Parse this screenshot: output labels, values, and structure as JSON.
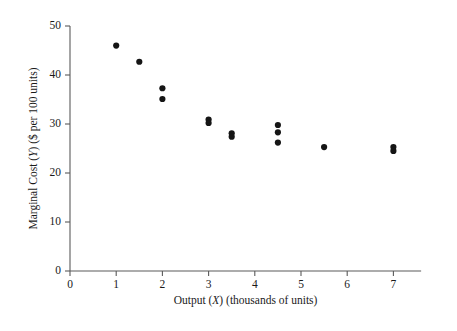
{
  "chart_data": {
    "type": "scatter",
    "title": "",
    "xlabel": "Output (X) (thousands of units)",
    "ylabel": "Marginal Cost (Y) ($ per 100 units)",
    "xlabel_parts": {
      "pre": "Output (",
      "var": "X",
      "post": ") (thousands of units)"
    },
    "ylabel_parts": {
      "pre": "Marginal Cost (",
      "var": "Y",
      "post": ") ($ per 100 units)"
    },
    "xlim": [
      0,
      7.6
    ],
    "ylim": [
      0,
      50
    ],
    "xticks": [
      0,
      1,
      2,
      3,
      4,
      5,
      6,
      7
    ],
    "xtick_labels": [
      "0",
      "1",
      "2",
      "3",
      "4",
      "5",
      "6",
      "7"
    ],
    "yticks": [
      0,
      10,
      20,
      30,
      40,
      50
    ],
    "ytick_labels": [
      "0",
      "10",
      "20",
      "30",
      "40",
      "50"
    ],
    "grid": false,
    "legend": false,
    "marker_color": "#151515",
    "axis_color": "#5a5a5a",
    "background": "#ffffff",
    "x": [
      1.0,
      1.5,
      2.0,
      2.0,
      3.0,
      3.0,
      3.5,
      3.5,
      4.5,
      4.5,
      4.5,
      5.5,
      7.0,
      7.0
    ],
    "y": [
      46.0,
      42.7,
      37.3,
      35.1,
      30.9,
      30.2,
      28.1,
      27.4,
      29.8,
      28.3,
      26.2,
      25.3,
      25.3,
      24.5
    ],
    "points": [
      {
        "x": 1.0,
        "y": 46.0
      },
      {
        "x": 1.5,
        "y": 42.7
      },
      {
        "x": 2.0,
        "y": 37.3
      },
      {
        "x": 2.0,
        "y": 35.1
      },
      {
        "x": 3.0,
        "y": 30.9
      },
      {
        "x": 3.0,
        "y": 30.2
      },
      {
        "x": 3.5,
        "y": 28.1
      },
      {
        "x": 3.5,
        "y": 27.4
      },
      {
        "x": 4.5,
        "y": 29.8
      },
      {
        "x": 4.5,
        "y": 28.3
      },
      {
        "x": 4.5,
        "y": 26.2
      },
      {
        "x": 5.5,
        "y": 25.3
      },
      {
        "x": 7.0,
        "y": 25.3
      },
      {
        "x": 7.0,
        "y": 24.5
      }
    ]
  }
}
